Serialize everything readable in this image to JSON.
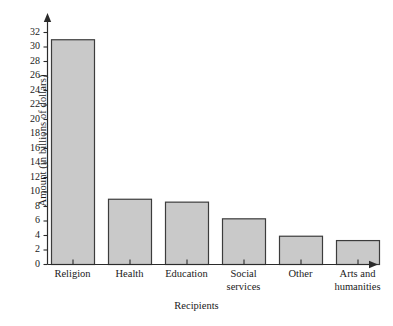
{
  "chart_data": {
    "type": "bar",
    "title": "",
    "subtitle": "",
    "xlabel": "Recipients",
    "ylabel": "Amount (in billions of dollars)",
    "categories": [
      "Religion",
      "Health",
      "Education",
      "Social services",
      "Other",
      "Arts and humanities"
    ],
    "values": [
      31,
      9,
      8.6,
      6.3,
      3.9,
      3.3
    ],
    "series": [
      {
        "name": "Amount",
        "values": [
          31,
          9,
          8.6,
          6.3,
          3.9,
          3.3
        ]
      }
    ],
    "ylim": [
      0,
      32
    ],
    "ytick_step": 2,
    "yticks": [
      0,
      2,
      4,
      6,
      8,
      10,
      12,
      14,
      16,
      18,
      20,
      22,
      24,
      26,
      28,
      30,
      32
    ],
    "ytick_labels": [
      "0",
      "2",
      "4",
      "6",
      "8",
      "10",
      "12",
      "14",
      "16",
      "18",
      "20",
      "22",
      "24",
      "26",
      "28",
      "30",
      "32"
    ],
    "grid": false,
    "legend": "none",
    "bar_fill_color": "#c9c9c9",
    "bar_edge_color": "#3c3c3c",
    "axis_color": "#2b2b2b",
    "text_color": "#1a1a1a",
    "background_color": "#ffffff",
    "axis_arrowheads": true
  },
  "axis": {
    "y_title": "Amount (in billions of dollars)",
    "x_title": "Recipients"
  },
  "categories_display": [
    "Religion",
    "Health",
    "Education",
    "Social\nservices",
    "Other",
    "Arts and\nhumanities"
  ]
}
